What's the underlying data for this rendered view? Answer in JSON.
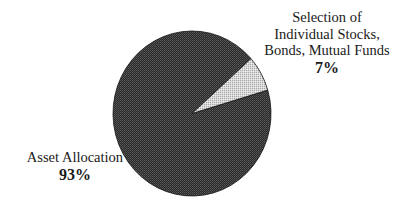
{
  "chart_data": {
    "type": "pie",
    "title": "",
    "slices": [
      {
        "name": "Asset Allocation",
        "value": 93,
        "label": "93%",
        "color": "#3a3a3a",
        "pattern": "dark-checker"
      },
      {
        "name": "Selection of Individual Stocks, Bonds, Mutual Funds",
        "value": 7,
        "label": "7%",
        "color": "#c8c8c8",
        "pattern": "light-checker"
      }
    ],
    "legend": "none",
    "labels_position": "outside"
  },
  "labels": {
    "small_slice": {
      "line1": "Selection of",
      "line2": "Individual Stocks,",
      "line3": "Bonds, Mutual Funds",
      "percent": "7%"
    },
    "large_slice": {
      "line1": "Asset Allocation",
      "percent": "93%"
    }
  }
}
